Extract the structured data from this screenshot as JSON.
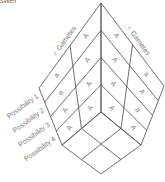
{
  "header": {
    "text": "swer"
  },
  "diagram": {
    "male_label": "♂ Gametes",
    "female_label": "♀ Gametes",
    "possibilities": [
      "Possibility 1",
      "Possibility 2",
      "Possibility 3",
      "Possibility 4"
    ],
    "male_grid": [
      [
        "a",
        "A"
      ],
      [
        "a",
        "A"
      ],
      [
        "A",
        "A"
      ],
      [
        "A",
        "A"
      ]
    ],
    "female_grid": [
      [
        "A",
        "a"
      ],
      [
        "A",
        "A"
      ],
      [
        "A",
        "a"
      ],
      [
        "A",
        "A"
      ]
    ]
  }
}
